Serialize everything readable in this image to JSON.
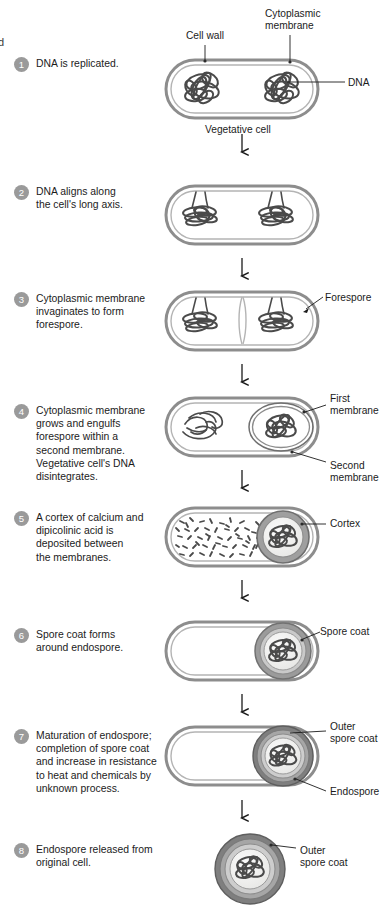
{
  "figure": {
    "margin_text": "d",
    "cell_label_bottom": "Vegetative cell"
  },
  "callouts": {
    "cell_wall": "Cell wall",
    "cytoplasmic_membrane": "Cytoplasmic\nmembrane",
    "dna": "DNA",
    "forespore": "Forespore",
    "first_membrane": "First\nmembrane",
    "second_membrane": "Second\nmembrane",
    "cortex": "Cortex",
    "spore_coat": "Spore coat",
    "outer_spore_coat": "Outer\nspore coat",
    "endospore": "Endospore",
    "outer_spore_coat_final": "Outer\nspore coat"
  },
  "steps": [
    {
      "number": "1",
      "text": "DNA is replicated."
    },
    {
      "number": "2",
      "text": "DNA aligns along\nthe cell's long axis."
    },
    {
      "number": "3",
      "text": "Cytoplasmic membrane\ninvaginates to form\nforespore."
    },
    {
      "number": "4",
      "text": "Cytoplasmic membrane\ngrows and engulfs\nforespore within a\nsecond membrane.\nVegetative cell's DNA\ndisintegrates."
    },
    {
      "number": "5",
      "text": "A cortex of calcium and\ndipicolinic acid is\ndeposited between\nthe membranes."
    },
    {
      "number": "6",
      "text": "Spore coat forms\naround endospore."
    },
    {
      "number": "7",
      "text": "Maturation of endospore;\ncompletion of spore coat\nand increase in resistance\nto heat and chemicals by\nunknown process."
    },
    {
      "number": "8",
      "text": "Endospore released from\noriginal cell."
    }
  ],
  "colors": {
    "cell_wall": "#8d8d8d",
    "cytoplasm": "#e8e8e6",
    "dna": "#4a4a4a",
    "badge": "#9a9a9a",
    "coat_dark": "#7c7c7c",
    "coat_mid": "#a8a8a8",
    "coat_light": "#d4d4d4",
    "text": "#1b1b1b"
  }
}
